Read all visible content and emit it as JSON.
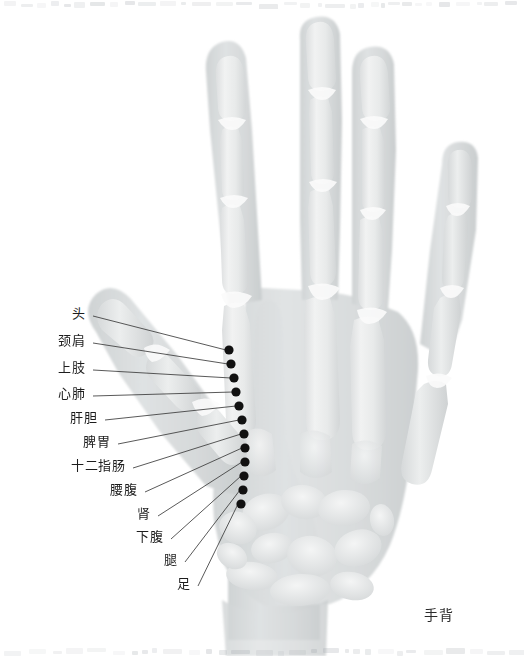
{
  "figure": {
    "title_caption": "手背",
    "background_color": "#ffffff",
    "width": 524,
    "height": 656
  },
  "anatomy": {
    "subject": "hand-xray-dorsal",
    "bone_fill": "#e3e5e6",
    "soft_tissue_fill": "#d9dcdd",
    "outline_color": "#c6c9cb"
  },
  "markers": {
    "dot_color": "#111111",
    "leader_color": "#3b3b3b",
    "dot_radius": 4.6,
    "count": 12
  },
  "annotations": [
    {
      "id": "head",
      "label": "头",
      "label_x": 85,
      "label_y": 320,
      "dot_x": 229,
      "dot_y": 350
    },
    {
      "id": "neck",
      "label": "颈肩",
      "label_x": 85,
      "label_y": 347,
      "dot_x": 231,
      "dot_y": 364
    },
    {
      "id": "upper-limb",
      "label": "上肢",
      "label_x": 85,
      "label_y": 374,
      "dot_x": 234,
      "dot_y": 378
    },
    {
      "id": "heart-lung",
      "label": "心肺",
      "label_x": 85,
      "label_y": 400,
      "dot_x": 236,
      "dot_y": 392
    },
    {
      "id": "liver-gall",
      "label": "肝胆",
      "label_x": 97,
      "label_y": 424,
      "dot_x": 239,
      "dot_y": 406
    },
    {
      "id": "spleen",
      "label": "脾胃",
      "label_x": 110,
      "label_y": 448,
      "dot_x": 242,
      "dot_y": 420
    },
    {
      "id": "duodenum",
      "label": "十二指肠",
      "label_x": 125,
      "label_y": 472,
      "dot_x": 244,
      "dot_y": 434
    },
    {
      "id": "lumbar",
      "label": "腰腹",
      "label_x": 137,
      "label_y": 496,
      "dot_x": 245,
      "dot_y": 448
    },
    {
      "id": "kidney",
      "label": "肾",
      "label_x": 150,
      "label_y": 520,
      "dot_x": 245,
      "dot_y": 462
    },
    {
      "id": "lower-abd",
      "label": "下腹",
      "label_x": 163,
      "label_y": 543,
      "dot_x": 244,
      "dot_y": 476
    },
    {
      "id": "leg",
      "label": "腿",
      "label_x": 177,
      "label_y": 566,
      "dot_x": 243,
      "dot_y": 490
    },
    {
      "id": "foot",
      "label": "足",
      "label_x": 190,
      "label_y": 590,
      "dot_x": 241,
      "dot_y": 504
    }
  ]
}
